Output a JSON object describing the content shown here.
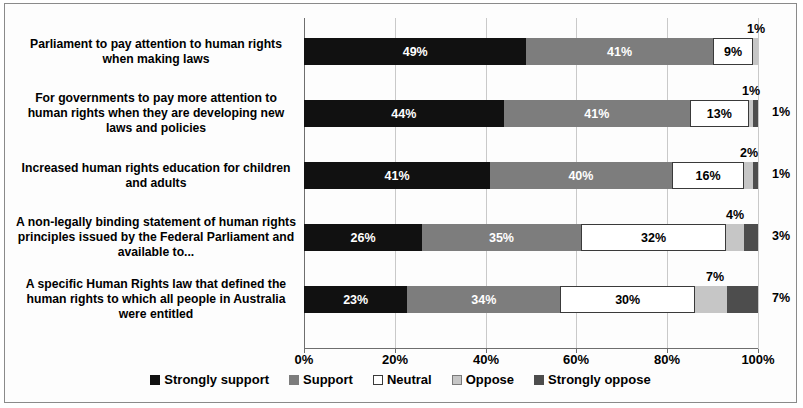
{
  "chart_data": {
    "type": "bar",
    "subtype": "stacked-horizontal-100",
    "title": "",
    "xlabel": "",
    "ylabel": "",
    "xlim": [
      0,
      100
    ],
    "xticks": [
      "0%",
      "20%",
      "40%",
      "60%",
      "80%",
      "100%"
    ],
    "grid": true,
    "legend_position": "bottom",
    "categories": [
      "Parliament to pay attention to human rights when making laws",
      "For governments to pay more attention to human rights when they are developing new laws and policies",
      "Increased human rights education for children and adults",
      "A non-legally binding statement of human rights principles issued by the Federal Parliament and available to...",
      "A specific Human Rights law that defined the human rights to which all people in Australia were entitled"
    ],
    "series": [
      {
        "name": "Strongly support",
        "color": "#111111",
        "values": [
          49,
          44,
          41,
          26,
          23
        ]
      },
      {
        "name": "Support",
        "color": "#7d7d7d",
        "values": [
          41,
          41,
          40,
          35,
          34
        ]
      },
      {
        "name": "Neutral",
        "color": "#ffffff",
        "values": [
          9,
          13,
          16,
          32,
          30
        ]
      },
      {
        "name": "Oppose",
        "color": "#c6c6c6",
        "values": [
          1,
          1,
          2,
          4,
          7
        ]
      },
      {
        "name": "Strongly oppose",
        "color": "#4d4d4d",
        "values": [
          0,
          1,
          1,
          3,
          7
        ]
      }
    ],
    "rows": [
      {
        "label": "Parliament to pay attention to human rights when making laws",
        "segments": [
          {
            "series": "Strongly support",
            "value": 49,
            "label": "49%",
            "label_position": "inside"
          },
          {
            "series": "Support",
            "value": 41,
            "label": "41%",
            "label_position": "inside"
          },
          {
            "series": "Neutral",
            "value": 9,
            "label": "9%",
            "label_position": "inside"
          },
          {
            "series": "Oppose",
            "value": 1,
            "label": "1%",
            "label_position": "above"
          }
        ]
      },
      {
        "label": "For governments to pay more attention to human rights when they are developing new laws and policies",
        "segments": [
          {
            "series": "Strongly support",
            "value": 44,
            "label": "44%",
            "label_position": "inside"
          },
          {
            "series": "Support",
            "value": 41,
            "label": "41%",
            "label_position": "inside"
          },
          {
            "series": "Neutral",
            "value": 13,
            "label": "13%",
            "label_position": "inside"
          },
          {
            "series": "Oppose",
            "value": 1,
            "label": "1%",
            "label_position": "above"
          },
          {
            "series": "Strongly oppose",
            "value": 1,
            "label": "1%",
            "label_position": "right"
          }
        ]
      },
      {
        "label": "Increased human rights education for children and adults",
        "segments": [
          {
            "series": "Strongly support",
            "value": 41,
            "label": "41%",
            "label_position": "inside"
          },
          {
            "series": "Support",
            "value": 40,
            "label": "40%",
            "label_position": "inside"
          },
          {
            "series": "Neutral",
            "value": 16,
            "label": "16%",
            "label_position": "inside"
          },
          {
            "series": "Oppose",
            "value": 2,
            "label": "2%",
            "label_position": "above"
          },
          {
            "series": "Strongly oppose",
            "value": 1,
            "label": "1%",
            "label_position": "right"
          }
        ]
      },
      {
        "label": "A non-legally binding statement of human rights principles issued by the Federal Parliament and available to...",
        "segments": [
          {
            "series": "Strongly support",
            "value": 26,
            "label": "26%",
            "label_position": "inside"
          },
          {
            "series": "Support",
            "value": 35,
            "label": "35%",
            "label_position": "inside"
          },
          {
            "series": "Neutral",
            "value": 32,
            "label": "32%",
            "label_position": "inside"
          },
          {
            "series": "Oppose",
            "value": 4,
            "label": "4%",
            "label_position": "above"
          },
          {
            "series": "Strongly oppose",
            "value": 3,
            "label": "3%",
            "label_position": "right"
          }
        ]
      },
      {
        "label": "A specific Human Rights law that defined the human rights to which all people in Australia were entitled",
        "segments": [
          {
            "series": "Strongly support",
            "value": 23,
            "label": "23%",
            "label_position": "inside"
          },
          {
            "series": "Support",
            "value": 34,
            "label": "34%",
            "label_position": "inside"
          },
          {
            "series": "Neutral",
            "value": 30,
            "label": "30%",
            "label_position": "inside"
          },
          {
            "series": "Oppose",
            "value": 7,
            "label": "7%",
            "label_position": "above"
          },
          {
            "series": "Strongly oppose",
            "value": 7,
            "label": "7%",
            "label_position": "right"
          }
        ]
      }
    ],
    "legend": [
      {
        "label": "Strongly support",
        "color": "#111111"
      },
      {
        "label": "Support",
        "color": "#7d7d7d"
      },
      {
        "label": "Neutral",
        "color": "#ffffff"
      },
      {
        "label": "Oppose",
        "color": "#c6c6c6"
      },
      {
        "label": "Strongly oppose",
        "color": "#4d4d4d"
      }
    ]
  }
}
